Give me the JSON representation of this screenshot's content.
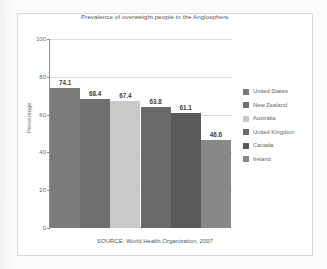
{
  "chart_data": {
    "type": "bar",
    "title": "Prevalence of overweight people in the Anglosphere",
    "xlabel": "",
    "ylabel": "Percentage",
    "ylim": [
      0,
      100
    ],
    "yticks": [
      0,
      20,
      40,
      60,
      80,
      100
    ],
    "grid": true,
    "legend_position": "right",
    "categories": [
      "United States",
      "New Zealand",
      "Australia",
      "United Kingdom",
      "Canada",
      "Ireland"
    ],
    "values": [
      74.1,
      68.4,
      67.4,
      63.8,
      61.1,
      46.6
    ],
    "value_labels": [
      "74.1",
      "68.4",
      "67.4",
      "63.8",
      "61.1",
      "46.6"
    ],
    "bar_colors": [
      "#7b7b7b",
      "#6f6f6f",
      "#c9c9c9",
      "#6a6a6a",
      "#5a5a5a",
      "#888888"
    ],
    "source_note": "SOURCE: World Health Organization, 2007"
  },
  "axis": {
    "y_title": "Percentage",
    "tick_labels": [
      "100",
      "80",
      "60",
      "40",
      "20",
      "0"
    ]
  },
  "legend": {
    "items": [
      {
        "label": "United States",
        "color": "#7b7b7b"
      },
      {
        "label": "New Zealand",
        "color": "#6f6f6f"
      },
      {
        "label": "Australia",
        "color": "#c9c9c9"
      },
      {
        "label": "United Kingdom",
        "color": "#6a6a6a"
      },
      {
        "label": "Canada",
        "color": "#5a5a5a"
      },
      {
        "label": "Ireland",
        "color": "#888888"
      }
    ]
  },
  "footer": {
    "source": "SOURCE: World Health Organization, 2007"
  }
}
